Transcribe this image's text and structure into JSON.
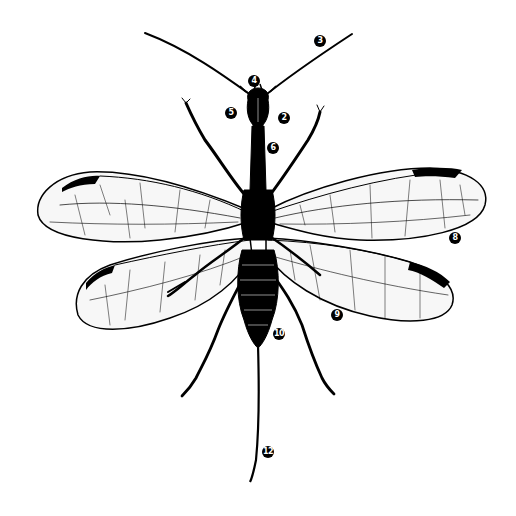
{
  "diagram": {
    "labels": [
      {
        "id": "3",
        "text": "3",
        "x": 320,
        "y": 41
      },
      {
        "id": "4",
        "text": "4",
        "x": 254,
        "y": 81
      },
      {
        "id": "5",
        "text": "5",
        "x": 231,
        "y": 113
      },
      {
        "id": "2",
        "text": "2",
        "x": 284,
        "y": 118
      },
      {
        "id": "6",
        "text": "6",
        "x": 273,
        "y": 148
      },
      {
        "id": "8",
        "text": "8",
        "x": 455,
        "y": 238
      },
      {
        "id": "9",
        "text": "9",
        "x": 337,
        "y": 315
      },
      {
        "id": "10",
        "text": "10",
        "x": 279,
        "y": 334
      },
      {
        "id": "12",
        "text": "12",
        "x": 268,
        "y": 452
      }
    ],
    "colors": {
      "ink": "#000000",
      "background": "#ffffff",
      "wing_fill": "#f7f7f7"
    }
  }
}
